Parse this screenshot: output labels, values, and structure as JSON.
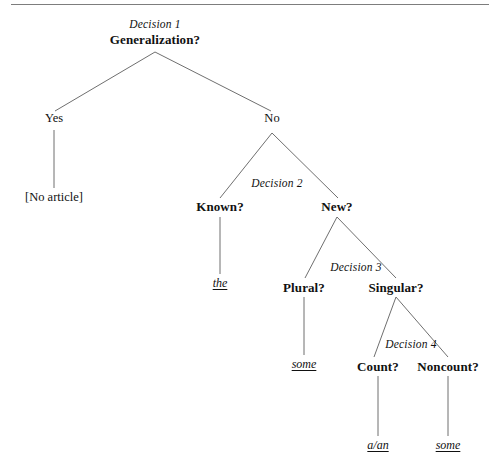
{
  "figure": {
    "type": "decision-tree",
    "title_rule": "horizontal-rule",
    "root": {
      "decision_label": "Decision 1",
      "question": "Generalization?"
    },
    "nodes": {
      "yes": "Yes",
      "no": "No",
      "no_article": "[No article]",
      "decision_2": "Decision 2",
      "known": "Known?",
      "new": "New?",
      "the": "the",
      "decision_3": "Decision 3",
      "plural": "Plural?",
      "singular": "Singular?",
      "some_plural": "some",
      "decision_4": "Decision 4",
      "count": "Count?",
      "noncount": "Noncount?",
      "a_an": "a/an",
      "some_noncount": "some"
    },
    "colors": {
      "line": "#6f6f6f",
      "rule": "#7d7d7d",
      "text": "#111111",
      "background": "#ffffff"
    }
  }
}
